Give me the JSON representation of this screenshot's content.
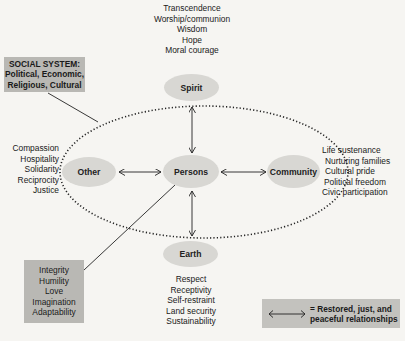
{
  "social_system": {
    "lines": [
      "SOCIAL SYSTEM:",
      "Political, Economic,",
      "Religious, Cultural"
    ]
  },
  "nodes": {
    "spirit": "Spirit",
    "other": "Other",
    "persons": "Persons",
    "community": "Community",
    "earth": "Earth"
  },
  "spirit_values": [
    "Transcendence",
    "Worship/communion",
    "Wisdom",
    "Hope",
    "Moral courage"
  ],
  "other_values": [
    "Compassion",
    "Hospitality",
    "Solidarity",
    "Reciprocity",
    "Justice"
  ],
  "community_values": [
    "Life sustenance",
    "Nurturing families",
    "Cultural pride",
    "Political freedom",
    "Civic participation"
  ],
  "earth_values": [
    "Respect",
    "Receptivity",
    "Self-restraint",
    "Land security",
    "Sustainability"
  ],
  "person_virtues": [
    "Integrity",
    "Humility",
    "Love",
    "Imagination",
    "Adaptability"
  ],
  "legend": {
    "arrow_icon": "double-headed-arrow",
    "lines": [
      "= Restored, just, and",
      "peaceful relationships"
    ]
  },
  "colors": {
    "background": "#f6f5f2",
    "node_fill": "#d8d7d3",
    "box_fill": "#b9b8b4",
    "legend_fill": "#c3c2be",
    "line": "#222222"
  }
}
